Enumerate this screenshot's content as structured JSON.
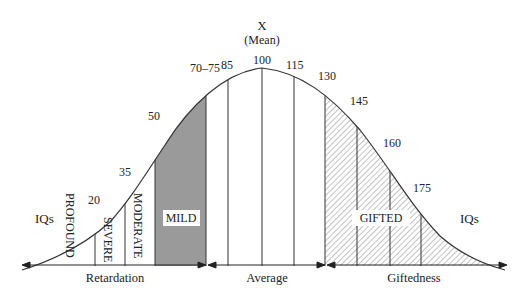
{
  "diagram": {
    "mean_label": "X",
    "mean_sublabel": "(Mean)",
    "left_tail_label": "IQs",
    "right_tail_label": "IQs",
    "iq_ticks": [
      "20",
      "35",
      "50",
      "70–75",
      "85",
      "100",
      "115",
      "130",
      "145",
      "160",
      "175"
    ],
    "categories": {
      "profound": "PROFOUND",
      "severe": "SEVERE",
      "moderate": "MODERATE",
      "mild": "MILD",
      "gifted": "GIFTED"
    },
    "ranges": {
      "retardation": "Retardation",
      "average": "Average",
      "giftedness": "Giftedness"
    },
    "colors": {
      "mild_fill": "#9a9a9a",
      "line": "#333333",
      "hatch": "#555555"
    }
  }
}
